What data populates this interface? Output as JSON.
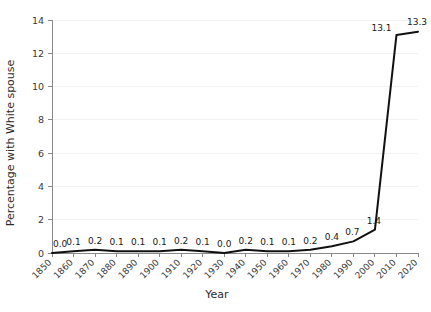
{
  "chart_data": {
    "type": "line",
    "title": "",
    "xlabel": "Year",
    "ylabel": "Percentage with White spouse",
    "xlim": [
      1850,
      2020
    ],
    "ylim": [
      0,
      14
    ],
    "ytick_step": 2,
    "grid": true,
    "legend": "none",
    "line_color": "#111111",
    "categories": [
      1850,
      1860,
      1870,
      1880,
      1890,
      1900,
      1910,
      1920,
      1930,
      1940,
      1950,
      1960,
      1970,
      1980,
      1990,
      2000,
      2010,
      2020
    ],
    "values": [
      0.0,
      0.1,
      0.2,
      0.1,
      0.1,
      0.1,
      0.2,
      0.1,
      0.0,
      0.2,
      0.1,
      0.1,
      0.2,
      0.4,
      0.7,
      1.4,
      13.1,
      13.3
    ],
    "point_labels": [
      "0.0",
      "0.1",
      "0.2",
      "0.1",
      "0.1",
      "0.1",
      "0.2",
      "0.1",
      "0.0",
      "0.2",
      "0.1",
      "0.1",
      "0.2",
      "0.4",
      "0.7",
      "1.4",
      "13.1",
      "13.3"
    ],
    "xtick_labels": [
      "1850",
      "1860",
      "1870",
      "1880",
      "1890",
      "1900",
      "1910",
      "1920",
      "1930",
      "1940",
      "1950",
      "1960",
      "1970",
      "1980",
      "1990",
      "2000",
      "2010",
      "2020"
    ],
    "ytick_labels": [
      "0",
      "2",
      "4",
      "6",
      "8",
      "10",
      "12",
      "14"
    ],
    "ytick_values": [
      0,
      2,
      4,
      6,
      8,
      10,
      12,
      14
    ]
  }
}
